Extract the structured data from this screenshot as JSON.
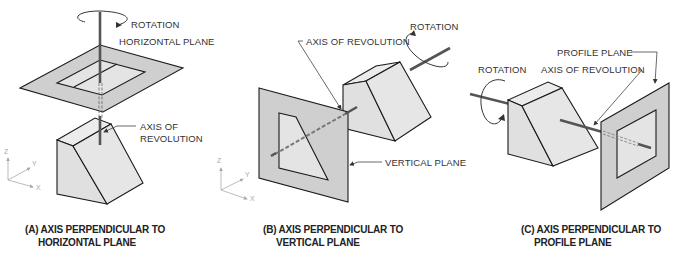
{
  "figure": {
    "views": [
      {
        "id": "A",
        "caption_line1": "(A) AXIS PERPENDICULAR TO",
        "caption_line2": "HORIZONTAL PLANE",
        "labels": {
          "rotation": "ROTATION",
          "plane": "HORIZONTAL PLANE",
          "axis_line1": "AXIS OF",
          "axis_line2": "REVOLUTION"
        },
        "coordinate_axes": {
          "z": "Z",
          "y": "Y",
          "x": "X"
        }
      },
      {
        "id": "B",
        "caption_line1": "(B) AXIS PERPENDICULAR TO",
        "caption_line2": "VERTICAL PLANE",
        "labels": {
          "rotation": "ROTATION",
          "axis": "AXIS OF REVOLUTION",
          "plane": "VERTICAL PLANE"
        },
        "coordinate_axes": {
          "z": "Z",
          "y": "Y",
          "x": "X"
        }
      },
      {
        "id": "C",
        "caption_line1": "(C) AXIS PERPENDICULAR TO",
        "caption_line2": "PROFILE PLANE",
        "labels": {
          "rotation": "ROTATION",
          "plane": "PROFILE PLANE",
          "axis": "AXIS OF REVOLUTION"
        }
      }
    ],
    "colors": {
      "plane_fill": "#cfcfcf",
      "inner_fill": "#e4e4e4",
      "solid_fill": "#e2e2e2",
      "outline": "#1a1a1a",
      "axis_rod": "#555555",
      "label_text": "#333333",
      "leader": "#444444"
    }
  }
}
